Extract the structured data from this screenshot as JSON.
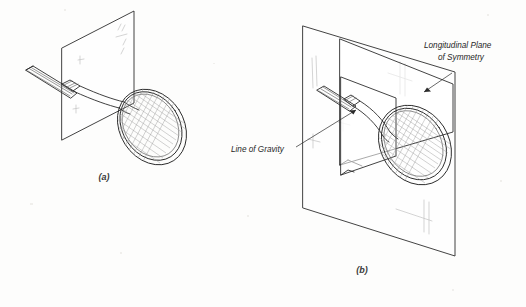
{
  "figure": {
    "kind": "line-drawing",
    "background_color": "#fdfdfc",
    "ink_color": "#2b2b2b"
  },
  "panels": [
    {
      "id": "a",
      "caption": "(a)",
      "caption_x": 104,
      "caption_y": 180,
      "objects": [
        "single-plane",
        "tennis-racket"
      ],
      "annotations": []
    },
    {
      "id": "b",
      "caption": "(b)",
      "caption_x": 362,
      "caption_y": 273,
      "objects": [
        "background-plane",
        "vertical-plane",
        "tennis-racket"
      ],
      "annotations": [
        "line-of-gravity",
        "longitudinal-plane-of-symmetry"
      ]
    }
  ],
  "annotations": {
    "line_of_gravity": {
      "label": "Line of Gravity",
      "x": 231,
      "y": 152,
      "anchor": "start"
    },
    "longitudinal_plane": {
      "line1": "Longitudinal Plane",
      "line2": "of Symmetry",
      "line1_x": 424,
      "line1_y": 48,
      "line2_x": 438,
      "line2_y": 60,
      "anchor": "start"
    }
  },
  "captions": {
    "a": "(a)",
    "b": "(b)"
  }
}
